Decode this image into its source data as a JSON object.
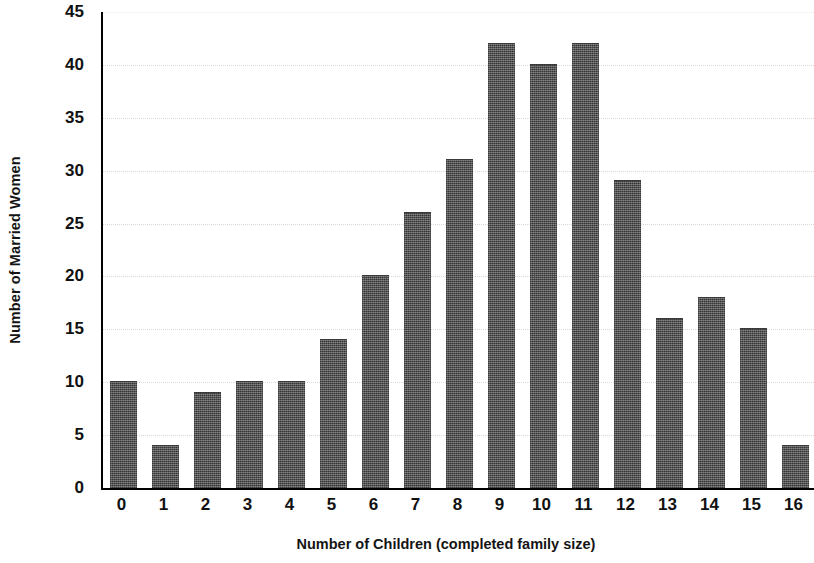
{
  "chart_data": {
    "type": "bar",
    "title": "",
    "xlabel": "Number of Children (completed family size)",
    "ylabel": "Number of Married Women",
    "categories": [
      "0",
      "1",
      "2",
      "3",
      "4",
      "5",
      "6",
      "7",
      "8",
      "9",
      "10",
      "11",
      "12",
      "13",
      "14",
      "15",
      "16"
    ],
    "values": [
      10,
      4,
      9,
      10,
      10,
      14,
      20,
      26,
      31,
      42,
      40,
      42,
      29,
      16,
      18,
      15,
      4
    ],
    "ylim": [
      0,
      45
    ],
    "ytick_labels": [
      "0",
      "5",
      "10",
      "15",
      "20",
      "25",
      "30",
      "35",
      "40",
      "45"
    ],
    "ytick_values": [
      0,
      5,
      10,
      15,
      20,
      25,
      30,
      35,
      40,
      45
    ],
    "xlim_categories": [
      "0",
      "16"
    ],
    "grid": true,
    "grid_axis": "y",
    "legend": false,
    "bar_color": "#565656",
    "axis_color": "#000000",
    "grid_color": "#d8d8d8",
    "background_color": "#ffffff"
  }
}
